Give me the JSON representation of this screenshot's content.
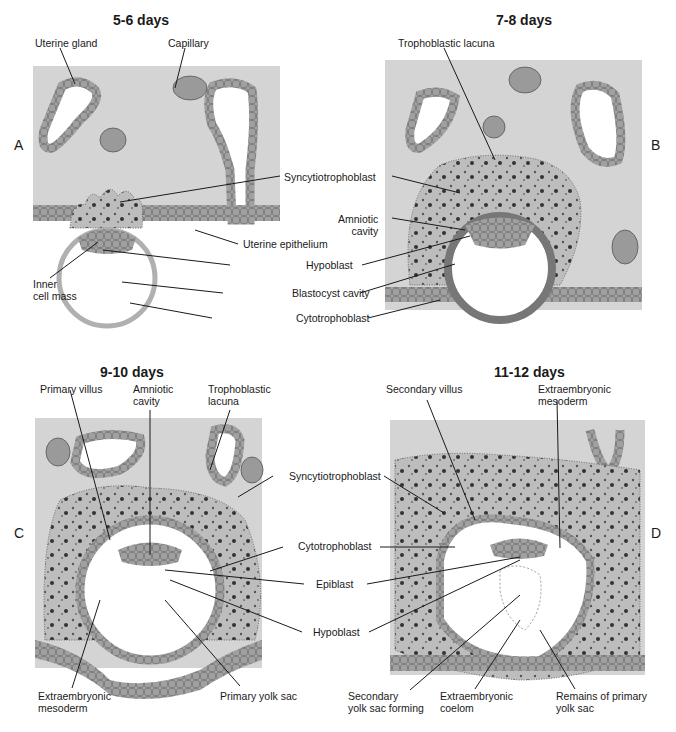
{
  "figure": {
    "panels": [
      {
        "letter": "A",
        "title": "5-6 days"
      },
      {
        "letter": "B",
        "title": "7-8 days"
      },
      {
        "letter": "C",
        "title": "9-10 days"
      },
      {
        "letter": "D",
        "title": "11-12 days"
      }
    ],
    "labels": {
      "a_uterine_gland": "Uterine gland",
      "a_capillary": "Capillary",
      "b_trophoblastic_lacuna": "Trophoblastic lacuna",
      "ab_syncytiotrophoblast": "Syncytiotrophoblast",
      "b_amniotic_cavity": "Amniotic\ncavity",
      "a_uterine_epithelium": "Uterine epithelium",
      "ab_hypoblast": "Hypoblast",
      "a_inner_cell_mass": "Inner\ncell mass",
      "ab_blastocyst_cavity": "Blastocyst cavity",
      "ab_cytotrophoblast": "Cytotrophoblast",
      "c_primary_villus": "Primary villus",
      "c_amniotic_cavity": "Amniotic\ncavity",
      "c_trophoblastic_lacuna": "Trophoblastic\nlacuna",
      "d_secondary_villus": "Secondary villus",
      "d_extraembryonic_mesoderm": "Extraembryonic\nmesoderm",
      "cd_syncytiotrophoblast": "Syncytiotrophoblast",
      "cd_cytotrophoblast": "Cytotrophoblast",
      "cd_epiblast": "Epiblast",
      "cd_hypoblast": "Hypoblast",
      "c_extraembryonic_mesoderm": "Extraembryonic\nmesoderm",
      "c_primary_yolk_sac": "Primary yolk sac",
      "d_secondary_yolk_sac_forming": "Secondary\nyolk sac forming",
      "d_extraembryonic_coelom": "Extraembryonic\ncoelom",
      "d_remains_primary_yolk_sac": "Remains of primary\nyolk sac"
    },
    "colors": {
      "endometrium": "#d4d4d4",
      "trophoblast": "#bdbdbd",
      "cell": "#9a9a9a",
      "dark_cell": "#7a7a7a",
      "line": "#1a1a1a"
    }
  }
}
